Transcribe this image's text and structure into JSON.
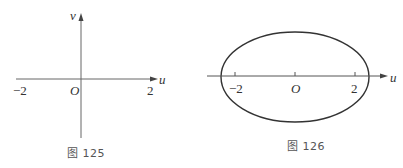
{
  "figures": [
    {
      "caption": "图 125",
      "axes": {
        "horizontal_label": "u",
        "vertical_label": "v",
        "origin_label": "O",
        "tick_labels": [
          "−2",
          "2"
        ]
      }
    },
    {
      "caption": "图 126",
      "axes": {
        "horizontal_label": "u",
        "origin_label": "O",
        "tick_labels": [
          "−2",
          "2"
        ]
      },
      "shape": "ellipse"
    }
  ],
  "colors": {
    "stroke": "#333333",
    "axis": "#555555",
    "background": "#ffffff"
  }
}
